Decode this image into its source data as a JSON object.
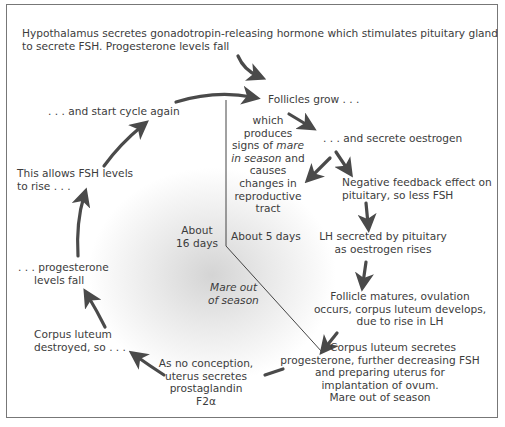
{
  "diagram": {
    "steps": {
      "hypothalamus": [
        "Hypothalamus secretes gonadotropin-releasing hormone which stimulates pituitary gland",
        "to secrete FSH. Progesterone levels fall"
      ],
      "follicles_grow": "Follicles grow . . .",
      "secrete_oestrogen": ". . . and secrete oestrogen",
      "signs_in_season": {
        "line1": "which",
        "line2": "produces",
        "line3_pre": "signs of ",
        "line3_italic": "mare",
        "line4_italic": "in season",
        "line4_post": " and",
        "line5": "causes",
        "line6": "changes in",
        "line7": "reproductive",
        "line8": "tract"
      },
      "negative_feedback": [
        "Negative feedback effect on",
        "pituitary, so less FSH"
      ],
      "lh_secreted": [
        "LH secreted by pituitary",
        "as oestrogen rises"
      ],
      "follicle_matures": [
        "Follicle matures, ovulation",
        "occurs, corpus luteum develops,",
        "due to rise in LH"
      ],
      "corpus_luteum_secretes": [
        "Corpus luteum secretes",
        "progesterone, further decreasing FSH",
        "and preparing uterus for",
        "implantation of ovum.",
        "Mare out of season"
      ],
      "no_conception": [
        "As no conception,",
        "uterus secretes",
        "prostaglandin",
        "F2α"
      ],
      "corpus_luteum_destroyed": [
        "Corpus luteum",
        "destroyed, so . . ."
      ],
      "progesterone_fall": [
        ". . . progesterone",
        "levels fall"
      ],
      "fsh_rise": [
        "This allows FSH levels",
        "to rise . . ."
      ],
      "start_again": ". . . and start cycle again"
    },
    "durations": {
      "in_season": "About 5 days",
      "out_of_season": [
        "About",
        "16 days"
      ],
      "out_of_season_label": [
        "Mare out",
        "of season"
      ]
    },
    "colors": {
      "arrow": "#4a4a4a",
      "text": "#3c3c3c",
      "frame": "#777777",
      "shade": "#d4d4d4"
    }
  }
}
